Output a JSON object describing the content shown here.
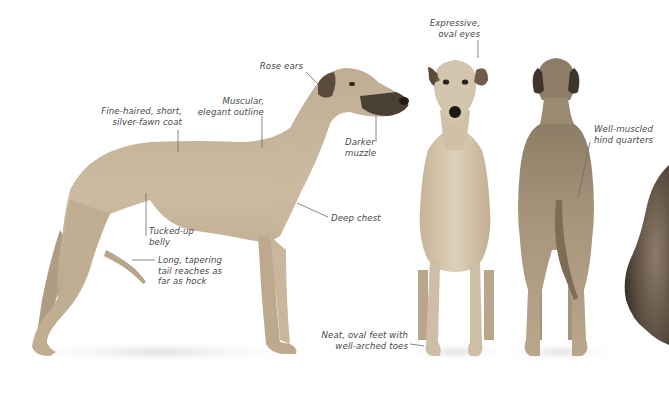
{
  "figure": {
    "views": [
      "side view",
      "front view",
      "rear view"
    ],
    "colors": {
      "background": "#ffffff",
      "coat": "#c9b79c",
      "coat_shadow": "#a8977c",
      "coat_light": "#ddd0ba",
      "muzzle": "#3a322b",
      "ear": "#6b5a48",
      "label_text": "#4a4a4a",
      "leader_line": "#6a6a6a",
      "floor_shadow": "#e6e6e6"
    }
  },
  "annotations": [
    {
      "id": "rose-ears",
      "text": "Rose ears",
      "x": 263,
      "y": 67,
      "align": "right",
      "line": [
        [
          306,
          72
        ],
        [
          318,
          84
        ]
      ]
    },
    {
      "id": "fine-haired-coat",
      "text": "Fine-haired, short,\nsilver-fawn coat",
      "x": 107,
      "y": 107,
      "align": "right",
      "line": [
        [
          178,
          130
        ],
        [
          178,
          152
        ]
      ]
    },
    {
      "id": "muscular-outline",
      "text": "Muscular,\nelegant outline",
      "x": 203,
      "y": 96,
      "align": "right",
      "line": [
        [
          262,
          116
        ],
        [
          262,
          148
        ]
      ]
    },
    {
      "id": "darker-muzzle",
      "text": "Darker\nmuzzle",
      "x": 346,
      "y": 139,
      "align": "right",
      "line": [
        [
          376,
          115
        ],
        [
          376,
          142
        ]
      ]
    },
    {
      "id": "expressive-eyes",
      "text": "Expressive,\noval eyes",
      "x": 432,
      "y": 20,
      "align": "right",
      "line": [
        [
          478,
          40
        ],
        [
          478,
          58
        ]
      ]
    },
    {
      "id": "well-muscled-hind",
      "text": "Well-muscled\nhind quarters",
      "x": 594,
      "y": 126,
      "align": "left",
      "line": [
        [
          590,
          142
        ],
        [
          578,
          198
        ]
      ]
    },
    {
      "id": "deep-chest",
      "text": "Deep chest",
      "x": 331,
      "y": 213,
      "align": "left",
      "line": [
        [
          297,
          203
        ],
        [
          328,
          217
        ]
      ]
    },
    {
      "id": "tucked-up-belly",
      "text": "Tucked-up\nbelly",
      "x": 149,
      "y": 227,
      "align": "left",
      "line": [
        [
          146,
          193
        ],
        [
          146,
          236
        ]
      ]
    },
    {
      "id": "long-tail",
      "text": "Long, tapering\ntail reaches as\nfar as hock",
      "x": 158,
      "y": 256,
      "align": "left",
      "line": [
        [
          132,
          260
        ],
        [
          155,
          260
        ]
      ]
    },
    {
      "id": "oval-feet",
      "text": "Neat, oval feet with\nwell-arched toes",
      "x": 333,
      "y": 331,
      "align": "right",
      "line": [
        [
          410,
          344
        ],
        [
          424,
          346
        ]
      ]
    }
  ]
}
